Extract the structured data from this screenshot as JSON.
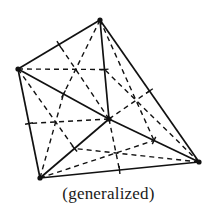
{
  "figure": {
    "caption": "(generalized)",
    "stroke_color": "#111111",
    "background": "#ffffff",
    "vertices": {
      "T": [
        100,
        20
      ],
      "L": [
        18,
        69
      ],
      "BL": [
        40,
        178
      ],
      "R": [
        199,
        162
      ],
      "C": [
        109,
        119
      ]
    },
    "solid_edges": [
      [
        "T",
        "L"
      ],
      [
        "L",
        "BL"
      ],
      [
        "BL",
        "R"
      ],
      [
        "R",
        "T"
      ],
      [
        "T",
        "C"
      ],
      [
        "L",
        "C"
      ],
      [
        "BL",
        "C"
      ],
      [
        "R",
        "C"
      ]
    ],
    "triangles": [
      [
        "T",
        "L",
        "C"
      ],
      [
        "L",
        "BL",
        "C"
      ],
      [
        "BL",
        "R",
        "C"
      ],
      [
        "R",
        "T",
        "C"
      ]
    ],
    "dashed_lines": "medians of each triangle (vertex to midpoint of opposite side)",
    "tick_marks": "short perpendicular ticks at each solid-edge midpoint"
  }
}
